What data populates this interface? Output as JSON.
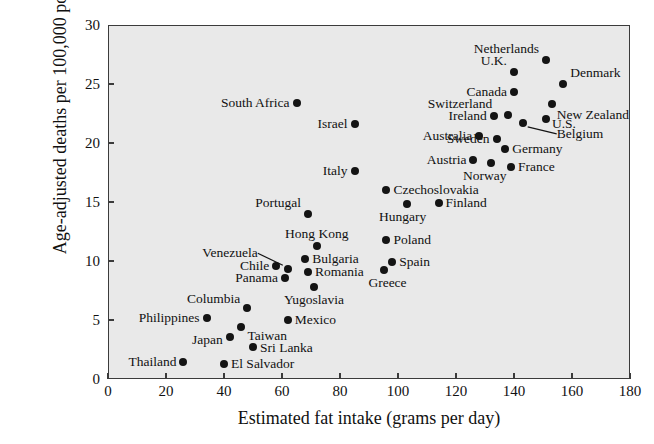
{
  "chart_data": {
    "type": "scatter",
    "title": "",
    "xlabel": "Estimated fat intake (grams per day)",
    "ylabel": "Age-adjusted deaths per 100,000 population",
    "xlim": [
      0,
      180
    ],
    "ylim": [
      0,
      30
    ],
    "xticks": [
      0,
      20,
      40,
      60,
      80,
      100,
      120,
      140,
      160,
      180
    ],
    "yticks": [
      0,
      5,
      10,
      15,
      20,
      25,
      30
    ],
    "grid": false,
    "legend": "none",
    "plot_background": "#e9e9e9",
    "point_color": "#141414",
    "frame_color": "#3b3b3b",
    "points": [
      {
        "label": "Netherlands",
        "x": 151,
        "y": 27.0,
        "lpos": "r",
        "ldx": -7,
        "ldy": -11
      },
      {
        "label": "U.K.",
        "x": 140,
        "y": 26.0,
        "lpos": "r",
        "ldx": -7,
        "ldy": -11
      },
      {
        "label": "Denmark",
        "x": 157,
        "y": 25.0,
        "lpos": "l",
        "ldx": 7,
        "ldy": -11
      },
      {
        "label": "Canada",
        "x": 140,
        "y": 24.3,
        "lpos": "r",
        "ldx": -7,
        "ldy": 0
      },
      {
        "label": "New Zealand",
        "x": 153,
        "y": 23.3,
        "lpos": "l",
        "ldx": 5,
        "ldy": 11
      },
      {
        "label": "South Africa",
        "x": 65,
        "y": 23.4,
        "lpos": "r",
        "ldx": -7,
        "ldy": 0
      },
      {
        "label": "Switzerland",
        "x": 138,
        "y": 22.4,
        "lpos": "r",
        "ldx": -16,
        "ldy": -11
      },
      {
        "label": "Ireland",
        "x": 133,
        "y": 22.3,
        "lpos": "r",
        "ldx": -7,
        "ldy": 0
      },
      {
        "label": "U.S.",
        "x": 151,
        "y": 22.0,
        "lpos": "l",
        "ldx": 6,
        "ldy": 5
      },
      {
        "label": "Israel",
        "x": 85,
        "y": 21.6,
        "lpos": "r",
        "ldx": -7,
        "ldy": 0
      },
      {
        "label": "Belgium",
        "x": 143,
        "y": 21.7,
        "lpos": "l",
        "ldx": 34,
        "ldy": 11,
        "leader": true
      },
      {
        "label": "Sweden",
        "x": 134,
        "y": 20.3,
        "lpos": "r",
        "ldx": -7,
        "ldy": 0
      },
      {
        "label": "Australia",
        "x": 128,
        "y": 20.6,
        "lpos": "r",
        "ldx": -7,
        "ldy": 0
      },
      {
        "label": "Germany",
        "x": 137,
        "y": 19.5,
        "lpos": "l",
        "ldx": 7,
        "ldy": 0
      },
      {
        "label": "Austria",
        "x": 126,
        "y": 18.6,
        "lpos": "r",
        "ldx": -7,
        "ldy": 0
      },
      {
        "label": "France",
        "x": 139,
        "y": 18.0,
        "lpos": "l",
        "ldx": 7,
        "ldy": 0
      },
      {
        "label": "Norway",
        "x": 132,
        "y": 18.3,
        "lpos": "c",
        "ldx": -6,
        "ldy": 13
      },
      {
        "label": "Italy",
        "x": 85,
        "y": 17.6,
        "lpos": "r",
        "ldx": -7,
        "ldy": 0
      },
      {
        "label": "Czechoslovakia",
        "x": 96,
        "y": 16.0,
        "lpos": "l",
        "ldx": 7,
        "ldy": 0
      },
      {
        "label": "Finland",
        "x": 114,
        "y": 14.9,
        "lpos": "l",
        "ldx": 7,
        "ldy": 0
      },
      {
        "label": "Portugal",
        "x": 69,
        "y": 14.0,
        "lpos": "r",
        "ldx": -7,
        "ldy": -11
      },
      {
        "label": "Hungary",
        "x": 103,
        "y": 14.8,
        "lpos": "c",
        "ldx": -4,
        "ldy": 13
      },
      {
        "label": "Poland",
        "x": 96,
        "y": 11.8,
        "lpos": "l",
        "ldx": 7,
        "ldy": 0
      },
      {
        "label": "Hong Kong",
        "x": 72,
        "y": 11.3,
        "lpos": "c",
        "ldx": 0,
        "ldy": -12
      },
      {
        "label": "Bulgaria",
        "x": 68,
        "y": 10.2,
        "lpos": "l",
        "ldx": 7,
        "ldy": 0
      },
      {
        "label": "Spain",
        "x": 98,
        "y": 9.9,
        "lpos": "l",
        "ldx": 7,
        "ldy": 0
      },
      {
        "label": "Chile",
        "x": 58,
        "y": 9.6,
        "lpos": "r",
        "ldx": -7,
        "ldy": 0
      },
      {
        "label": "Venezuela",
        "x": 62,
        "y": 9.3,
        "lpos": "r",
        "ldx": -30,
        "ldy": -16,
        "leader": true
      },
      {
        "label": "Romania",
        "x": 69,
        "y": 9.1,
        "lpos": "l",
        "ldx": 7,
        "ldy": 0
      },
      {
        "label": "Panama",
        "x": 61,
        "y": 8.6,
        "lpos": "r",
        "ldx": -7,
        "ldy": 0
      },
      {
        "label": "Greece",
        "x": 95,
        "y": 9.2,
        "lpos": "c",
        "ldx": 4,
        "ldy": 13
      },
      {
        "label": "Yugoslavia",
        "x": 71,
        "y": 7.8,
        "lpos": "c",
        "ldx": 0,
        "ldy": 13
      },
      {
        "label": "Columbia",
        "x": 48,
        "y": 6.0,
        "lpos": "r",
        "ldx": -7,
        "ldy": -9
      },
      {
        "label": "Philippines",
        "x": 34,
        "y": 5.2,
        "lpos": "r",
        "ldx": -7,
        "ldy": 0
      },
      {
        "label": "Mexico",
        "x": 62,
        "y": 5.0,
        "lpos": "l",
        "ldx": 7,
        "ldy": 0
      },
      {
        "label": "Taiwan",
        "x": 46,
        "y": 4.4,
        "lpos": "l",
        "ldx": 6,
        "ldy": 9
      },
      {
        "label": "Japan",
        "x": 42,
        "y": 3.6,
        "lpos": "r",
        "ldx": -7,
        "ldy": 3
      },
      {
        "label": "Sri Lanka",
        "x": 50,
        "y": 2.7,
        "lpos": "l",
        "ldx": 7,
        "ldy": 1
      },
      {
        "label": "Thailand",
        "x": 26,
        "y": 1.4,
        "lpos": "r",
        "ldx": -7,
        "ldy": 0
      },
      {
        "label": "El Salvador",
        "x": 40,
        "y": 1.3,
        "lpos": "l",
        "ldx": 7,
        "ldy": 0
      }
    ]
  }
}
